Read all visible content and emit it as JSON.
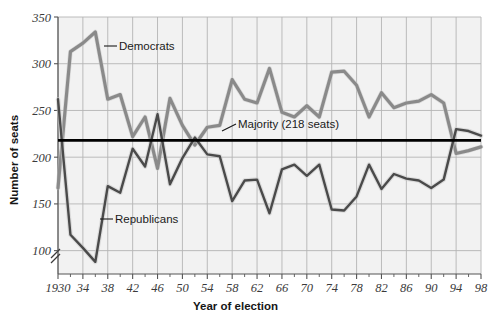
{
  "chart_data": {
    "type": "line",
    "title": "",
    "xlabel": "Year of election",
    "ylabel": "Number of seats",
    "xlim": [
      1930,
      1998
    ],
    "ylim": [
      75,
      350
    ],
    "grid": true,
    "legend_position": "inline-annotations",
    "y_ticks": [
      100,
      150,
      200,
      250,
      300,
      350
    ],
    "y_tick_labels": [
      "100",
      "150",
      "200",
      "250",
      "300",
      "350"
    ],
    "y_axis_break": true,
    "x_ticks": [
      1930,
      1934,
      1938,
      1942,
      1946,
      1950,
      1954,
      1958,
      1962,
      1966,
      1970,
      1974,
      1978,
      1982,
      1986,
      1990,
      1994,
      1998
    ],
    "x_tick_labels": [
      "1930",
      "34",
      "38",
      "42",
      "46",
      "50",
      "54",
      "58",
      "62",
      "66",
      "70",
      "74",
      "78",
      "82",
      "86",
      "90",
      "94",
      "98"
    ],
    "x_minor_step": 2,
    "x": [
      1930,
      1932,
      1934,
      1936,
      1938,
      1940,
      1942,
      1944,
      1946,
      1948,
      1950,
      1952,
      1954,
      1956,
      1958,
      1960,
      1962,
      1964,
      1966,
      1968,
      1970,
      1972,
      1974,
      1976,
      1978,
      1980,
      1982,
      1984,
      1986,
      1988,
      1990,
      1992,
      1994,
      1996,
      1998
    ],
    "series": [
      {
        "name": "Democrats",
        "color": "#8a8a8a",
        "values": [
          167,
          313,
          322,
          334,
          262,
          267,
          222,
          243,
          188,
          263,
          234,
          213,
          232,
          234,
          283,
          262,
          258,
          295,
          248,
          243,
          255,
          243,
          291,
          292,
          277,
          243,
          269,
          253,
          258,
          260,
          267,
          258,
          204,
          207,
          211
        ]
      },
      {
        "name": "Republicans",
        "color": "#4a4a4a",
        "values": [
          262,
          117,
          103,
          88,
          169,
          162,
          209,
          190,
          246,
          171,
          199,
          221,
          203,
          201,
          153,
          175,
          176,
          140,
          187,
          192,
          180,
          192,
          144,
          143,
          158,
          192,
          166,
          182,
          177,
          175,
          167,
          176,
          230,
          228,
          223
        ]
      }
    ],
    "annotations": [
      {
        "name": "majority-line",
        "label": "Majority (218 seats)",
        "value": 218
      },
      {
        "name": "democrats-label",
        "label": "Democrats"
      },
      {
        "name": "republicans-label",
        "label": "Republicans"
      }
    ],
    "colors": {
      "democrats": "#8a8a8a",
      "republicans": "#4a4a4a",
      "majority_line": "#000000",
      "grid": "#b4b4b4",
      "plot_background": "#f2f2f2",
      "axis": "#555555"
    }
  }
}
